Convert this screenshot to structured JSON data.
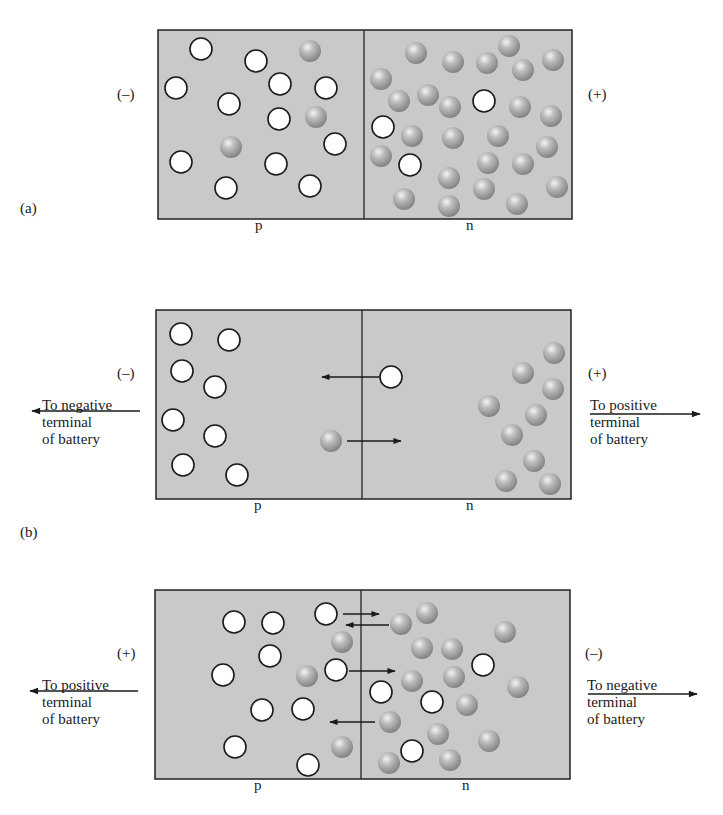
{
  "colors": {
    "box_fill": "#c9c9c9",
    "box_stroke": "#222222",
    "hole_fill": "#ffffff",
    "hole_stroke": "#1a1a1a",
    "electron_light": "#f2f2f2",
    "electron_mid": "#aeaeae",
    "electron_dark": "#7d7d7d",
    "arrow": "#1a1a1a"
  },
  "radius": 11,
  "panels": [
    {
      "id": "a",
      "label": "(a)",
      "label_pos": [
        20,
        213
      ],
      "box": {
        "x": 158,
        "y": 30,
        "w": 414,
        "h": 189,
        "divider_x": 364
      },
      "p_label": "p",
      "p_pos": [
        255,
        230
      ],
      "n_label": "n",
      "n_pos": [
        466,
        230
      ],
      "left_sign": "(–)",
      "left_sign_pos": [
        117,
        99
      ],
      "right_sign": "(+)",
      "right_sign_pos": [
        588,
        99
      ],
      "left_text": "",
      "right_text": "",
      "holes": [
        [
          201,
          49
        ],
        [
          256,
          61
        ],
        [
          176,
          88
        ],
        [
          280,
          84
        ],
        [
          326,
          88
        ],
        [
          229,
          104
        ],
        [
          279,
          119
        ],
        [
          335,
          144
        ],
        [
          181,
          162
        ],
        [
          276,
          164
        ],
        [
          226,
          188
        ],
        [
          310,
          186
        ],
        [
          484,
          101
        ],
        [
          383,
          127
        ],
        [
          410,
          165
        ]
      ],
      "electrons": [
        [
          310,
          51
        ],
        [
          316,
          117
        ],
        [
          231,
          147
        ],
        [
          416,
          53
        ],
        [
          453,
          62
        ],
        [
          487,
          63
        ],
        [
          509,
          46
        ],
        [
          523,
          70
        ],
        [
          553,
          60
        ],
        [
          381,
          79
        ],
        [
          399,
          101
        ],
        [
          428,
          95
        ],
        [
          450,
          107
        ],
        [
          520,
          107
        ],
        [
          551,
          116
        ],
        [
          412,
          136
        ],
        [
          453,
          138
        ],
        [
          498,
          136
        ],
        [
          547,
          147
        ],
        [
          381,
          156
        ],
        [
          488,
          163
        ],
        [
          523,
          164
        ],
        [
          449,
          178
        ],
        [
          484,
          189
        ],
        [
          557,
          187
        ],
        [
          404,
          199
        ],
        [
          449,
          206
        ],
        [
          517,
          204
        ]
      ],
      "arrows": []
    },
    {
      "id": "b",
      "label": "(b)",
      "label_pos": [
        20,
        537
      ],
      "box": {
        "x": 156,
        "y": 310,
        "w": 415,
        "h": 189,
        "divider_x": 362
      },
      "p_label": "p",
      "p_pos": [
        254,
        510
      ],
      "n_label": "n",
      "n_pos": [
        466,
        510
      ],
      "left_sign": "(–)",
      "left_sign_pos": [
        117,
        378
      ],
      "right_sign": "(+)",
      "right_sign_pos": [
        588,
        378
      ],
      "left_text": "To negative\nterminal\nof battery",
      "left_text_pos": [
        42,
        410
      ],
      "right_text": "To positive\nterminal\nof battery",
      "right_text_pos": [
        590,
        410
      ],
      "left_lead": {
        "x1": 140,
        "x2": 32,
        "y": 411
      },
      "right_lead": {
        "x1": 590,
        "x2": 700,
        "y": 414
      },
      "holes": [
        [
          181,
          334
        ],
        [
          229,
          340
        ],
        [
          182,
          371
        ],
        [
          215,
          387
        ],
        [
          173,
          420
        ],
        [
          215,
          436
        ],
        [
          183,
          465
        ],
        [
          237,
          475
        ],
        [
          391,
          377
        ]
      ],
      "electrons": [
        [
          331,
          441
        ],
        [
          554,
          353
        ],
        [
          523,
          373
        ],
        [
          553,
          389
        ],
        [
          489,
          406
        ],
        [
          536,
          415
        ],
        [
          512,
          435
        ],
        [
          534,
          461
        ],
        [
          506,
          481
        ],
        [
          550,
          484
        ]
      ],
      "arrows": [
        [
          380,
          377,
          322,
          377
        ],
        [
          347,
          441,
          401,
          441
        ]
      ]
    },
    {
      "id": "c",
      "label": "(c)",
      "label_pos": null,
      "box": {
        "x": 155,
        "y": 590,
        "w": 415,
        "h": 189,
        "divider_x": 361
      },
      "p_label": "p",
      "p_pos": [
        254,
        790
      ],
      "n_label": "n",
      "n_pos": [
        462,
        790
      ],
      "left_sign": "(+)",
      "left_sign_pos": [
        117,
        658
      ],
      "right_sign": "(–)",
      "right_sign_pos": [
        585,
        658
      ],
      "left_text": "To positive\nterminal\nof battery",
      "left_text_pos": [
        42,
        690
      ],
      "right_text": "To negative\nterminal\nof battery",
      "right_text_pos": [
        587,
        690
      ],
      "left_lead": {
        "x1": 138,
        "x2": 30,
        "y": 691
      },
      "right_lead": {
        "x1": 588,
        "x2": 697,
        "y": 694
      },
      "holes": [
        [
          234,
          622
        ],
        [
          273,
          623
        ],
        [
          326,
          614
        ],
        [
          270,
          656
        ],
        [
          223,
          675
        ],
        [
          336,
          670
        ],
        [
          262,
          710
        ],
        [
          303,
          709
        ],
        [
          235,
          747
        ],
        [
          308,
          765
        ],
        [
          381,
          692
        ],
        [
          432,
          702
        ],
        [
          483,
          665
        ],
        [
          412,
          751
        ]
      ],
      "electrons": [
        [
          342,
          642
        ],
        [
          307,
          676
        ],
        [
          342,
          747
        ],
        [
          401,
          624
        ],
        [
          427,
          613
        ],
        [
          505,
          632
        ],
        [
          422,
          648
        ],
        [
          452,
          649
        ],
        [
          412,
          681
        ],
        [
          454,
          677
        ],
        [
          518,
          687
        ],
        [
          467,
          705
        ],
        [
          390,
          722
        ],
        [
          438,
          734
        ],
        [
          489,
          741
        ],
        [
          389,
          763
        ],
        [
          450,
          760
        ]
      ],
      "arrows": [
        [
          343,
          614,
          379,
          614
        ],
        [
          389,
          625,
          346,
          625
        ],
        [
          349,
          671,
          395,
          671
        ],
        [
          375,
          722,
          330,
          722
        ]
      ]
    }
  ]
}
